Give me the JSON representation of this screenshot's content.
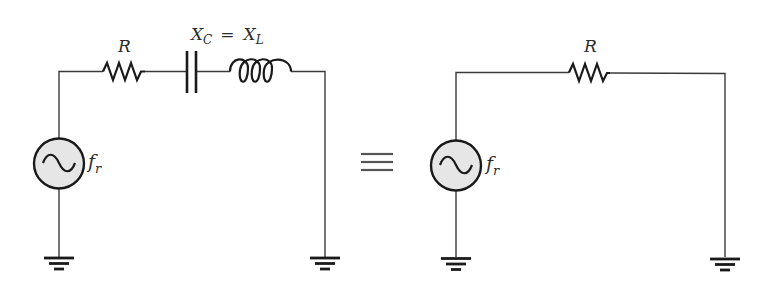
{
  "diagram": {
    "type": "circuit-equivalence",
    "colors": {
      "background": "#ffffff",
      "wire": "#3a3a3a",
      "component": "#1a1a1a",
      "source_fill": "#e6e6e6",
      "equivalence_symbol": "#555555",
      "label": "#2b2b2b"
    },
    "left_circuit": {
      "name": "series RLC at resonance",
      "resistor_label": "R",
      "reactance_label_xc": "X",
      "reactance_label_xc_sub": "C",
      "reactance_equals": "=",
      "reactance_label_xl": "X",
      "reactance_label_xl_sub": "L",
      "source_label": "f",
      "source_label_sub": "r",
      "components": [
        "ac-source",
        "resistor",
        "capacitor",
        "inductor",
        "ground",
        "ground"
      ]
    },
    "equivalence": {
      "symbol": "≡"
    },
    "right_circuit": {
      "name": "equivalent resistive circuit",
      "resistor_label": "R",
      "source_label": "f",
      "source_label_sub": "r",
      "components": [
        "ac-source",
        "resistor",
        "ground",
        "ground"
      ]
    }
  }
}
